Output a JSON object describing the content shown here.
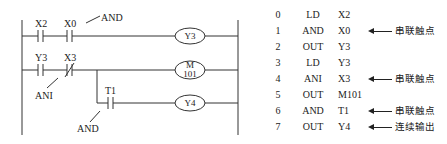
{
  "ladder": {
    "contacts": [
      {
        "name": "X2",
        "type": "NO"
      },
      {
        "name": "X0",
        "type": "NO"
      },
      {
        "name": "Y3",
        "type": "NO"
      },
      {
        "name": "X3",
        "type": "NC"
      },
      {
        "name": "T1",
        "type": "NO"
      }
    ],
    "coils": [
      {
        "line1": "Y3",
        "line2": ""
      },
      {
        "line1": "M",
        "line2": "101"
      },
      {
        "line1": "Y4",
        "line2": ""
      }
    ],
    "annotations": [
      "AND",
      "ANI",
      "AND"
    ]
  },
  "instruction_list": [
    {
      "step": "0",
      "op": "LD",
      "arg": "X2",
      "note": ""
    },
    {
      "step": "1",
      "op": "AND",
      "arg": "X0",
      "note": "串联触点"
    },
    {
      "step": "2",
      "op": "OUT",
      "arg": "Y3",
      "note": ""
    },
    {
      "step": "3",
      "op": "LD",
      "arg": "Y3",
      "note": ""
    },
    {
      "step": "4",
      "op": "ANI",
      "arg": "X3",
      "note": "串联触点"
    },
    {
      "step": "5",
      "op": "OUT",
      "arg": "M101",
      "note": ""
    },
    {
      "step": "6",
      "op": "AND",
      "arg": "T1",
      "note": "串联触点"
    },
    {
      "step": "7",
      "op": "OUT",
      "arg": "Y4",
      "note": "连续输出"
    }
  ]
}
